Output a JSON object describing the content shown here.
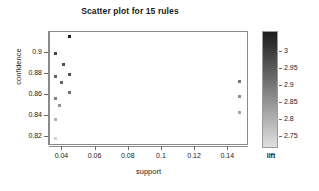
{
  "chart_data": {
    "type": "scatter",
    "title": "Scatter plot for 15 rules",
    "xlabel": "support",
    "ylabel": "confidence",
    "grid": false,
    "xlim": [
      0.0325,
      0.1525
    ],
    "ylim": [
      0.8115,
      0.9205
    ],
    "xticks": [
      "0.04",
      "0.06",
      "0.08",
      "0.1",
      "0.12",
      "0.14"
    ],
    "xtick_values": [
      0.04,
      0.06,
      0.08,
      0.1,
      0.12,
      0.14
    ],
    "yticks": [
      "0.82",
      "0.84",
      "0.86",
      "0.88",
      "0.9"
    ],
    "ytick_values": [
      0.82,
      0.84,
      0.86,
      0.88,
      0.9
    ],
    "point_shape": "square",
    "point_size_px": 3,
    "x": [
      0.0445,
      0.036,
      0.0408,
      0.0358,
      0.0443,
      0.0394,
      0.0358,
      0.0443,
      0.0381,
      0.0358,
      0.0358,
      0.1468,
      0.1468,
      0.1468,
      0.0358
    ],
    "y": [
      0.9165,
      0.9,
      0.889,
      0.878,
      0.88,
      0.8725,
      0.857,
      0.8625,
      0.8505,
      0.837,
      0.8185,
      0.8735,
      0.8585,
      0.8435,
      0.8185
    ],
    "lift": [
      3.05,
      2.99,
      2.97,
      2.94,
      2.96,
      2.93,
      2.88,
      2.91,
      2.85,
      2.8,
      2.74,
      2.9,
      2.86,
      2.82,
      2.74
    ],
    "series": [
      {
        "name": "rules",
        "points": [
          {
            "support": 0.0445,
            "confidence": 0.9165,
            "lift": 3.05
          },
          {
            "support": 0.036,
            "confidence": 0.9,
            "lift": 2.99
          },
          {
            "support": 0.0408,
            "confidence": 0.889,
            "lift": 2.97
          },
          {
            "support": 0.0358,
            "confidence": 0.878,
            "lift": 2.94
          },
          {
            "support": 0.0443,
            "confidence": 0.88,
            "lift": 2.96
          },
          {
            "support": 0.0394,
            "confidence": 0.8725,
            "lift": 2.93
          },
          {
            "support": 0.0358,
            "confidence": 0.857,
            "lift": 2.88
          },
          {
            "support": 0.0443,
            "confidence": 0.8625,
            "lift": 2.91
          },
          {
            "support": 0.0381,
            "confidence": 0.8505,
            "lift": 2.85
          },
          {
            "support": 0.0358,
            "confidence": 0.837,
            "lift": 2.8
          },
          {
            "support": 0.0358,
            "confidence": 0.8185,
            "lift": 2.74
          },
          {
            "support": 0.1468,
            "confidence": 0.8735,
            "lift": 2.9
          },
          {
            "support": 0.1468,
            "confidence": 0.8585,
            "lift": 2.86
          },
          {
            "support": 0.1468,
            "confidence": 0.8435,
            "lift": 2.82
          },
          {
            "support": 0.0358,
            "confidence": 0.8185,
            "lift": 2.74
          }
        ]
      }
    ],
    "legend": {
      "position": "right",
      "title": "lift",
      "type": "colorbar",
      "ticks": [
        "3",
        "2.95",
        "2.9",
        "2.85",
        "2.8",
        "2.75"
      ],
      "tick_values": [
        3,
        2.95,
        2.9,
        2.85,
        2.8,
        2.75
      ],
      "range": [
        2.715,
        3.06
      ],
      "color_high": "#1c1c1c",
      "color_low": "#e0e0e0"
    },
    "colors": {
      "frame": "#8a8a8a",
      "text": "#1a1a1a",
      "background": "#ffffff"
    }
  }
}
